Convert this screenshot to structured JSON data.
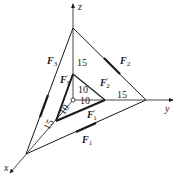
{
  "diagram": {
    "type": "3D force system on coordinate axes",
    "axes": [
      {
        "name": "x",
        "label": "x"
      },
      {
        "name": "y",
        "label": "y"
      },
      {
        "name": "z",
        "label": "z"
      }
    ],
    "dimensions": {
      "outer": {
        "x": "15",
        "y": "15",
        "z": "15"
      },
      "inner": {
        "x": "10",
        "y": "10",
        "z": "10"
      }
    },
    "forces": [
      {
        "id": "F1",
        "label": "F",
        "sub": "1",
        "prime": ""
      },
      {
        "id": "F2",
        "label": "F",
        "sub": "2",
        "prime": ""
      },
      {
        "id": "F3",
        "label": "F",
        "sub": "3",
        "prime": ""
      },
      {
        "id": "F1p",
        "label": "F",
        "sub": "1",
        "prime": "′"
      },
      {
        "id": "F2p",
        "label": "F",
        "sub": "2",
        "prime": "′"
      },
      {
        "id": "F3p",
        "label": "F",
        "sub": "3",
        "prime": "′"
      }
    ],
    "colors": {
      "line": "#1a1a1a",
      "background": "#ffffff"
    }
  }
}
